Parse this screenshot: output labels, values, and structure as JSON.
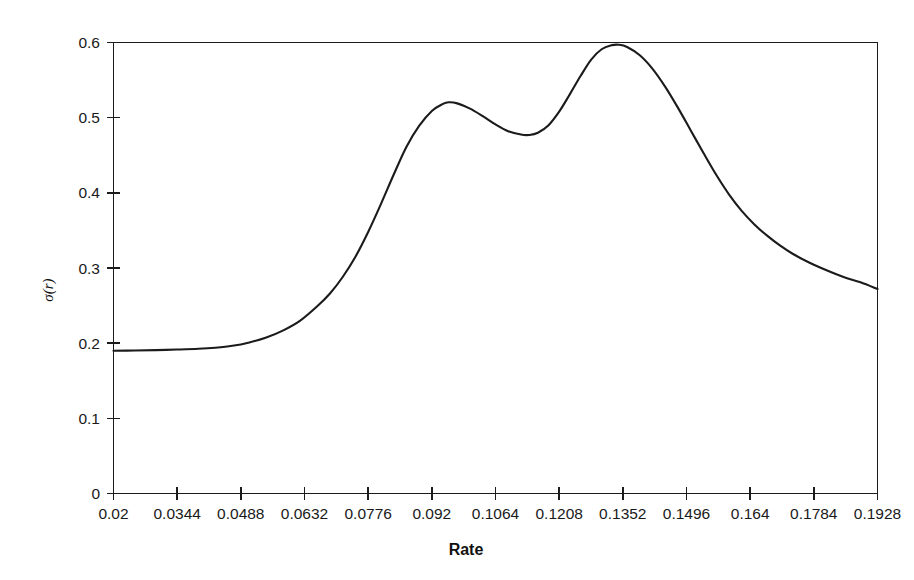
{
  "chart_data": {
    "type": "line",
    "title": "",
    "xlabel": "Rate",
    "ylabel": "σ(r)",
    "xlim": [
      0.02,
      0.2
    ],
    "ylim": [
      0,
      0.6
    ],
    "grid": false,
    "legend": "none",
    "xticks": [
      0.02,
      0.0344,
      0.0488,
      0.0632,
      0.0776,
      0.092,
      0.1064,
      0.1208,
      0.1352,
      0.1496,
      0.164,
      0.1784,
      0.1928
    ],
    "xtick_labels": [
      "0.02",
      "0.0344",
      "0.0488",
      "0.0632",
      "0.0776",
      "0.092",
      "0.1064",
      "0.1208",
      "0.1352",
      "0.1496",
      "0.164",
      "0.1784",
      "0.1928"
    ],
    "yticks": [
      0,
      0.1,
      0.2,
      0.3,
      0.4,
      0.5,
      0.6
    ],
    "ytick_labels": [
      "0",
      "0.1",
      "0.2",
      "0.3",
      "0.4",
      "0.5",
      "0.6"
    ],
    "series": [
      {
        "name": "sigma-of-r",
        "color": "#1b1b1b",
        "x": [
          0.02,
          0.025,
          0.03,
          0.035,
          0.04,
          0.044,
          0.048,
          0.052,
          0.056,
          0.06,
          0.064,
          0.068,
          0.071,
          0.074,
          0.077,
          0.08,
          0.083,
          0.086,
          0.089,
          0.092,
          0.095,
          0.0975,
          0.099,
          0.101,
          0.104,
          0.107,
          0.11,
          0.113,
          0.116,
          0.118,
          0.12,
          0.1225,
          0.125,
          0.1275,
          0.13,
          0.1325,
          0.135,
          0.1375,
          0.139,
          0.141,
          0.144,
          0.147,
          0.15,
          0.153,
          0.156,
          0.159,
          0.162,
          0.165,
          0.168,
          0.171,
          0.174,
          0.177,
          0.18,
          0.184,
          0.188,
          0.192,
          0.196,
          0.2
        ],
        "y": [
          0.19,
          0.1902,
          0.1908,
          0.1915,
          0.1925,
          0.194,
          0.1965,
          0.201,
          0.2075,
          0.217,
          0.23,
          0.249,
          0.266,
          0.288,
          0.315,
          0.348,
          0.385,
          0.424,
          0.461,
          0.489,
          0.509,
          0.518,
          0.5205,
          0.519,
          0.512,
          0.502,
          0.491,
          0.482,
          0.4775,
          0.477,
          0.48,
          0.49,
          0.508,
          0.531,
          0.555,
          0.577,
          0.591,
          0.5965,
          0.597,
          0.594,
          0.583,
          0.565,
          0.541,
          0.513,
          0.483,
          0.453,
          0.424,
          0.398,
          0.376,
          0.358,
          0.343,
          0.33,
          0.319,
          0.307,
          0.297,
          0.288,
          0.281,
          0.272
        ]
      }
    ],
    "annotations": {
      "first_local_max": {
        "x": 0.099,
        "y": 0.5205
      },
      "local_min": {
        "x": 0.118,
        "y": 0.477
      },
      "global_max": {
        "x": 0.139,
        "y": 0.597
      },
      "start_value": {
        "x": 0.02,
        "y": 0.19
      },
      "end_value": {
        "x": 0.2,
        "y": 0.272
      }
    }
  },
  "colors": {
    "curve": "#1b1b1b",
    "axis": "#1b1b1b",
    "background": "#ffffff",
    "text": "#1a1a1a"
  }
}
